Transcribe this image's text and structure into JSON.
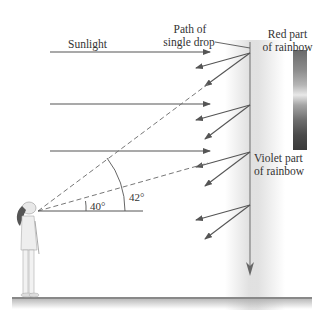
{
  "diagram": {
    "type": "rainbow-formation",
    "labels": {
      "sunlight": "Sunlight",
      "path_of_single_drop_line1": "Path of",
      "path_of_single_drop_line2": "single drop",
      "red_part_line1": "Red part",
      "red_part_line2": "of rainbow",
      "violet_part_line1": "Violet part",
      "violet_part_line2": "of rainbow"
    },
    "angles": {
      "inner": "40°",
      "outer": "42°"
    },
    "color_bar": {
      "description": "rainbow spectrum (grayscale)",
      "top": "red",
      "bottom": "violet"
    },
    "colors": {
      "line": "#555555",
      "dashed": "#777777",
      "text": "#333333",
      "ground": "#888888"
    }
  }
}
